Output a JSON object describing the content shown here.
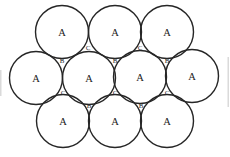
{
  "diagram": {
    "type": "close-packed-spheres-layer",
    "background": "#ffffff",
    "stroke_color": "#262626",
    "stroke_width": 1.4,
    "circle_radius": 26.5,
    "atom_label": "A",
    "atoms": [
      {
        "x": 62,
        "y": 32
      },
      {
        "x": 115,
        "y": 32
      },
      {
        "x": 167,
        "y": 32
      },
      {
        "x": 36,
        "y": 78
      },
      {
        "x": 89,
        "y": 78
      },
      {
        "x": 140,
        "y": 77
      },
      {
        "x": 192,
        "y": 76
      },
      {
        "x": 63,
        "y": 121
      },
      {
        "x": 115,
        "y": 121
      },
      {
        "x": 167,
        "y": 121
      }
    ],
    "site_labels": [
      {
        "label": "C",
        "x": 88,
        "y": 48
      },
      {
        "label": "C",
        "x": 140,
        "y": 48
      },
      {
        "label": "B",
        "x": 62,
        "y": 61
      },
      {
        "label": "B",
        "x": 115,
        "y": 61
      },
      {
        "label": "B",
        "x": 167,
        "y": 61
      },
      {
        "label": "C",
        "x": 63,
        "y": 93
      },
      {
        "label": "C",
        "x": 115,
        "y": 93
      },
      {
        "label": "C",
        "x": 167,
        "y": 93
      },
      {
        "label": "B",
        "x": 89,
        "y": 106
      },
      {
        "label": "B",
        "x": 141,
        "y": 106
      }
    ],
    "edge_artifacts": [
      {
        "x": 0,
        "y": 70,
        "w": 1.5,
        "h": 26
      },
      {
        "x": 227.5,
        "y": 57,
        "w": 1.5,
        "h": 50
      }
    ],
    "artifact_color": "#cbcbcb"
  }
}
